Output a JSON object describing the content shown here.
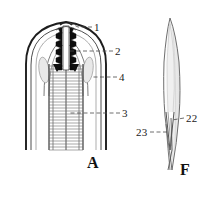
{
  "plate": {
    "title": "Nematode anatomical line drawing plate",
    "background_color": "#ffffff",
    "ink_color": "#1a1a1a",
    "width": 204,
    "height": 200
  },
  "figures": [
    {
      "letter": "A",
      "name": "anterior-end-head-region",
      "description": "Longitudinal section of nematode head showing cuticle, stylet with serrated rasp-like plates, and striated oesophageal tube",
      "labels": [
        {
          "id": "1",
          "text": "1",
          "target": "stylet-tip-apex"
        },
        {
          "id": "2",
          "text": "2",
          "target": "serrated-tooth-plate"
        },
        {
          "id": "4",
          "text": "4",
          "target": "lateral-gland-amphid"
        },
        {
          "id": "3",
          "text": "3",
          "target": "striated-oesophagus"
        }
      ]
    },
    {
      "letter": "F",
      "name": "spicule",
      "description": "Lance-shaped spicule with bifurcated distal tip",
      "labels": [
        {
          "id": "22",
          "text": "22",
          "target": "spicule-inner-tip"
        },
        {
          "id": "23",
          "text": "23",
          "target": "spicule-distal-point"
        }
      ]
    }
  ],
  "annotations": {
    "leader_line_style": "dashed",
    "leader_color": "#4a4a4a"
  }
}
